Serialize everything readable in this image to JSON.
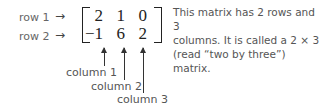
{
  "rows": [
    {
      "label": "row 1",
      "arrow": "→"
    },
    {
      "label": "row 2",
      "arrow": "→"
    }
  ],
  "matrix": [
    [
      "2",
      "1",
      "0"
    ],
    [
      "−1",
      "6",
      "2"
    ]
  ],
  "columns": [
    {
      "label": "column 1"
    },
    {
      "label": "column 2"
    },
    {
      "label": "column 3"
    }
  ],
  "description": {
    "line1": "This matrix has 2 rows and 3",
    "line2": "columns. It is called a 2 × 3",
    "line3": "(read “two by three”) matrix."
  }
}
